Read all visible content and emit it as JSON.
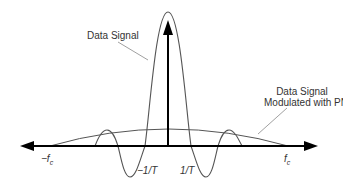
{
  "labels": {
    "data_signal": "Data Signal",
    "modulated_line1": "Data Signal",
    "modulated_line2": "Modulated with PN",
    "neg_fc": "−f",
    "neg_fc_sub": "c",
    "pos_fc": "f",
    "pos_fc_sub": "c",
    "neg_inv_t": "−1/T",
    "pos_inv_t": "1/T"
  },
  "colors": {
    "curve": "#555555",
    "axis": "#000000",
    "text": "#333333"
  },
  "axis": {
    "x_left": 20,
    "x_right": 318,
    "y": 146,
    "center_x": 168,
    "arrow_top": 20
  }
}
